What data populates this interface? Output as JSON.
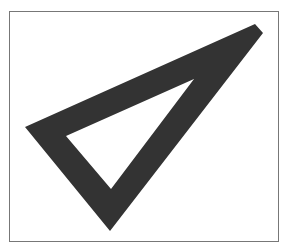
{
  "figure": {
    "colors": {
      "fill": "#333333",
      "frame": "#777777",
      "background": "#ffffff"
    },
    "outer_triangle": [
      [
        25,
        127
      ],
      [
        255,
        24
      ],
      [
        263,
        33
      ],
      [
        110,
        231
      ]
    ],
    "inner_triangle": [
      [
        66,
        136
      ],
      [
        194,
        79
      ],
      [
        111,
        189
      ]
    ]
  }
}
